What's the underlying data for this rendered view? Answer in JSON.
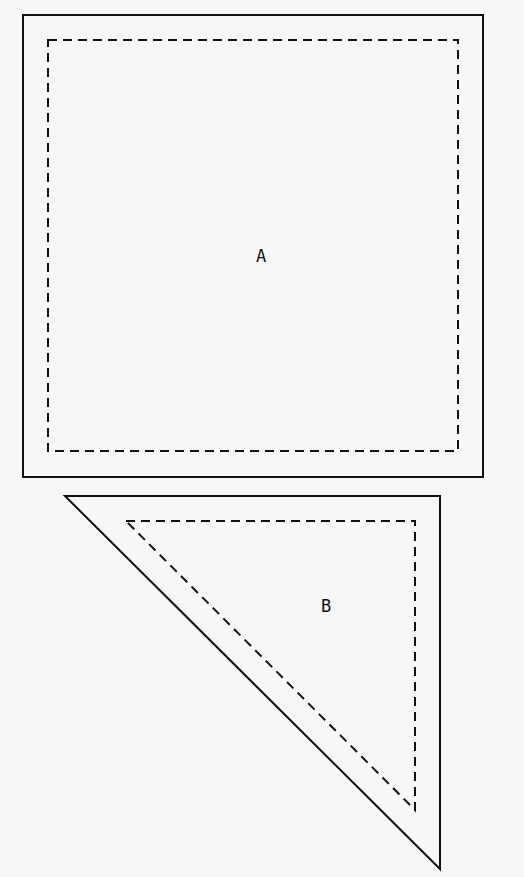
{
  "diagram": {
    "title": "",
    "pieces": [
      {
        "id": "A",
        "label": "A",
        "shape": "square",
        "outer": {
          "x": 23,
          "y": 15,
          "w": 460,
          "h": 462
        },
        "inner": {
          "x": 48,
          "y": 40,
          "w": 410,
          "h": 411
        },
        "label_pos": {
          "x": 261,
          "y": 262
        }
      },
      {
        "id": "B",
        "label": "B",
        "shape": "right-triangle",
        "outer_points": "65,496 440,496 440,869",
        "inner_points": "126,521 415,521 415,810",
        "label_pos": {
          "x": 326,
          "y": 612
        }
      }
    ],
    "colors": {
      "stroke": "#111111",
      "background": "#f7f7f7"
    },
    "legend": {
      "solid": "cut line",
      "dashed": "seam line"
    }
  }
}
